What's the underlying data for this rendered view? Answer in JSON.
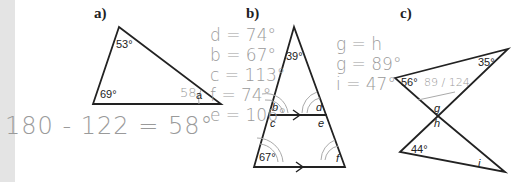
{
  "parts": {
    "a": {
      "label": "a)",
      "angles": {
        "top": "53°",
        "bottom_left": "69°"
      },
      "unknown": "a",
      "handwritten_answer": "58",
      "handwritten_work": "180 - 122 = 58°"
    },
    "b": {
      "label": "b)",
      "angles": {
        "apex": "39°",
        "bottom_left": "67°"
      },
      "unknowns": [
        "b",
        "c",
        "d",
        "e",
        "f"
      ],
      "handwritten_work": [
        "d = 74°",
        "b = 67°",
        "c = 113°",
        "f = 74°",
        "e = 106°"
      ]
    },
    "c": {
      "label": "c)",
      "angles": {
        "top_left": "56°",
        "top_right": "35°",
        "bottom_left": "44°"
      },
      "unknowns": [
        "g",
        "h",
        "i"
      ],
      "handwritten_scribble": "89 / 124",
      "handwritten_work": [
        "g = h",
        "g = 89°",
        "i = 47°"
      ]
    }
  },
  "colors": {
    "ink": "#222222",
    "pencil": "#9a9a9a",
    "margin_strip": "#e4e4e4"
  }
}
